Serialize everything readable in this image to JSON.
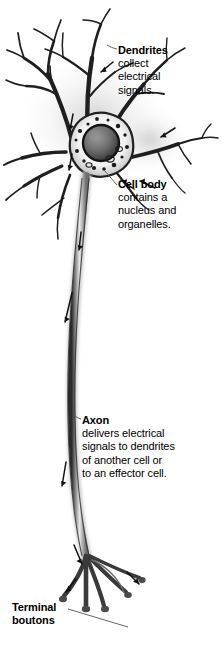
{
  "figure": {
    "colors": {
      "ink": "#1a1a1a",
      "shade_dark": "#4a4a4a",
      "shade_mid": "#8c8c8c",
      "shade_light": "#c9c9c9",
      "cell_fill": "#ffffff",
      "background": "#ffffff",
      "text": "#000000",
      "leader_line": "#555555"
    }
  },
  "labels": {
    "dendrites": {
      "heading": "Dendrites",
      "lines": [
        "collect",
        "electrical",
        "signals."
      ]
    },
    "cell_body": {
      "heading": "Cell body",
      "lines": [
        "contains a",
        "nucleus and",
        "organelles."
      ]
    },
    "axon": {
      "heading": "Axon",
      "lines": [
        "delivers electrical",
        "signals to dendrites",
        "of another cell or",
        "to an effector cell."
      ]
    },
    "terminal_boutons": {
      "heading": "Terminal",
      "lines": [
        "boutons"
      ]
    }
  },
  "parts": {
    "dendrite_tree": "dendrite-branches",
    "soma": "cell-body-soma",
    "nucleus": "nucleus",
    "organelles": "organelle-speckles",
    "axon": "axon-fiber",
    "terminals": "terminal-boutons-branches",
    "flow_arrows": "signal-direction-arrows"
  }
}
